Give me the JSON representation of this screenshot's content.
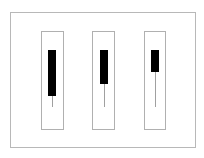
{
  "diagram": {
    "frame": {
      "x": 10,
      "y": 12,
      "w": 186,
      "h": 136,
      "border_color": "#b8b8b8"
    },
    "candles": [
      {
        "box": {
          "x": 41,
          "y": 31,
          "w": 23,
          "h": 99
        },
        "body": {
          "x": 48,
          "y": 50,
          "w": 8,
          "h": 46
        },
        "wick": {
          "top": 96,
          "bottom": 107
        }
      },
      {
        "box": {
          "x": 92,
          "y": 31,
          "w": 23,
          "h": 99
        },
        "body": {
          "x": 100,
          "y": 50,
          "w": 8,
          "h": 34
        },
        "wick": {
          "top": 84,
          "bottom": 107
        }
      },
      {
        "box": {
          "x": 144,
          "y": 31,
          "w": 22,
          "h": 99
        },
        "body": {
          "x": 151,
          "y": 50,
          "w": 8,
          "h": 22
        },
        "wick": {
          "top": 72,
          "bottom": 107
        }
      }
    ],
    "colors": {
      "body": "#000000",
      "wick": "#a0a0a0",
      "box_border": "#b0b0b0",
      "background": "#ffffff"
    }
  }
}
